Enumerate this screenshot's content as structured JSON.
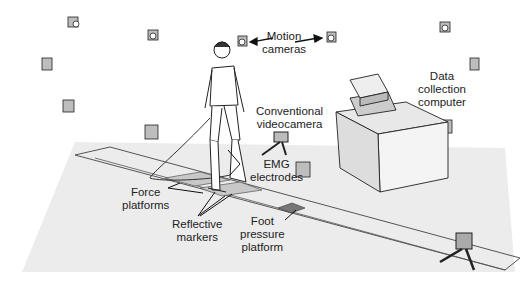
{
  "diagram": {
    "labels": {
      "motion_cameras": [
        "Motion",
        "cameras"
      ],
      "data_collection_computer": [
        "Data",
        "collection",
        "computer"
      ],
      "conventional_videocamera": [
        "Conventional",
        "videocamera"
      ],
      "emg_electrodes": [
        "EMG",
        "electrodes"
      ],
      "force_platforms": [
        "Force",
        "platforms"
      ],
      "reflective_markers": [
        "Reflective",
        "markers"
      ],
      "foot_pressure_platform": [
        "Foot",
        "pressure",
        "platform"
      ]
    },
    "colors": {
      "floor": "#ececec",
      "walkway_line": "#555555",
      "force_platform": "#c8c8c8",
      "pressure_platform": "#777777",
      "camera_body": "#bdbdbd",
      "ink": "#222222"
    }
  }
}
